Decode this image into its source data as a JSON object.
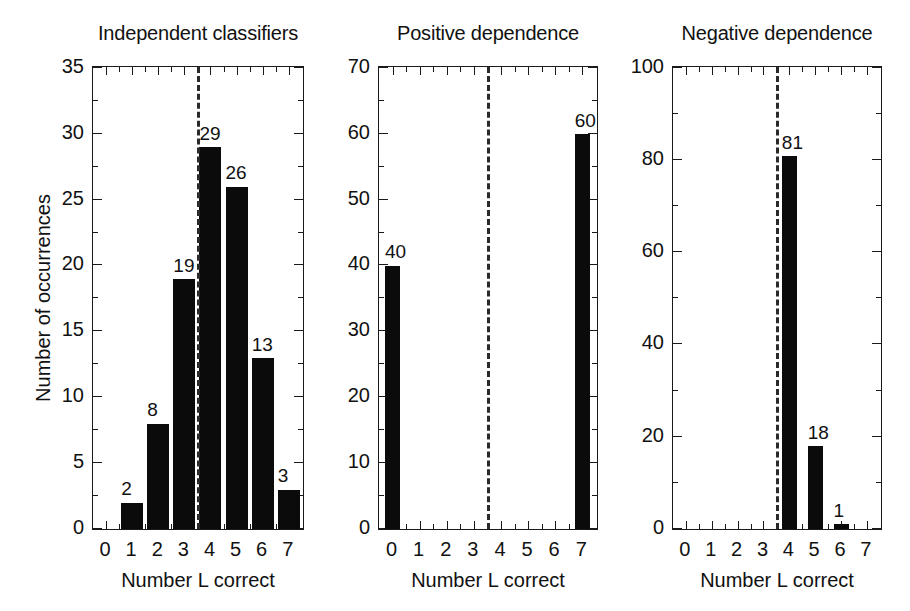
{
  "figure": {
    "background_color": "#ffffff",
    "bar_color": "#0b0b0b",
    "axis_color": "#1a1a1a",
    "threshold_line_color": "#2a2a2a",
    "shared_xlabel": "Number L correct",
    "shared_ylabel": "Number of occurrences"
  },
  "chart_data": [
    {
      "type": "bar",
      "title": "Independent classifiers",
      "xlabel": "Number L correct",
      "ylabel": "Number of occurrences",
      "categories": [
        0,
        1,
        2,
        3,
        4,
        5,
        6,
        7
      ],
      "xtick_labels": [
        "0",
        "1",
        "2",
        "3",
        "4",
        "5",
        "6",
        "7"
      ],
      "values": [
        0,
        2,
        8,
        19,
        29,
        26,
        13,
        3
      ],
      "bar_labels": [
        "",
        "2",
        "8",
        "19",
        "29",
        "26",
        "13",
        "3"
      ],
      "ylim": [
        0,
        35
      ],
      "yticks": [
        0,
        5,
        10,
        15,
        20,
        25,
        30,
        35
      ],
      "ytick_labels": [
        "0",
        "5",
        "10",
        "15",
        "20",
        "25",
        "30",
        "35"
      ],
      "xlim": [
        -0.5,
        7.5
      ],
      "grid": false,
      "legend": "none",
      "annotations": [
        {
          "kind": "vertical-dashed-line",
          "x": 3.5
        }
      ]
    },
    {
      "type": "bar",
      "title": "Positive dependence",
      "xlabel": "Number L correct",
      "ylabel": "",
      "categories": [
        0,
        1,
        2,
        3,
        4,
        5,
        6,
        7
      ],
      "xtick_labels": [
        "0",
        "1",
        "2",
        "3",
        "4",
        "5",
        "6",
        "7"
      ],
      "values": [
        40,
        0,
        0,
        0,
        0,
        0,
        0,
        60
      ],
      "bar_labels": [
        "40",
        "",
        "",
        "",
        "",
        "",
        "",
        "60"
      ],
      "ylim": [
        0,
        70
      ],
      "yticks": [
        0,
        10,
        20,
        30,
        40,
        50,
        60,
        70
      ],
      "ytick_labels": [
        "0",
        "10",
        "20",
        "30",
        "40",
        "50",
        "60",
        "70"
      ],
      "xlim": [
        -0.5,
        7.5
      ],
      "grid": false,
      "legend": "none",
      "annotations": [
        {
          "kind": "vertical-dashed-line",
          "x": 3.5
        }
      ]
    },
    {
      "type": "bar",
      "title": "Negative dependence",
      "xlabel": "Number L correct",
      "ylabel": "",
      "categories": [
        0,
        1,
        2,
        3,
        4,
        5,
        6,
        7
      ],
      "xtick_labels": [
        "0",
        "1",
        "2",
        "3",
        "4",
        "5",
        "6",
        "7"
      ],
      "values": [
        0,
        0,
        0,
        0,
        81,
        18,
        1,
        0
      ],
      "bar_labels": [
        "",
        "",
        "",
        "",
        "81",
        "18",
        "1",
        ""
      ],
      "ylim": [
        0,
        100
      ],
      "yticks": [
        0,
        20,
        40,
        60,
        80,
        100
      ],
      "ytick_labels": [
        "0",
        "20",
        "40",
        "60",
        "80",
        "100"
      ],
      "xlim": [
        -0.5,
        7.5
      ],
      "grid": false,
      "legend": "none",
      "annotations": [
        {
          "kind": "vertical-dashed-line",
          "x": 3.5
        }
      ]
    }
  ],
  "panels": [
    {
      "title": "Independent classifiers",
      "box": {
        "left": 92,
        "top": 66,
        "width": 212,
        "height": 464
      },
      "bar_width_px": 22,
      "label_offsets": [
        {
          "dx": 0,
          "dy": -22
        }
      ]
    },
    {
      "title": "Positive dependence",
      "box": {
        "left": 378,
        "top": 66,
        "width": 220,
        "height": 464
      },
      "bar_width_px": 15
    },
    {
      "title": "Negative dependence",
      "box": {
        "left": 672,
        "top": 66,
        "width": 210,
        "height": 464
      },
      "bar_width_px": 15
    }
  ]
}
